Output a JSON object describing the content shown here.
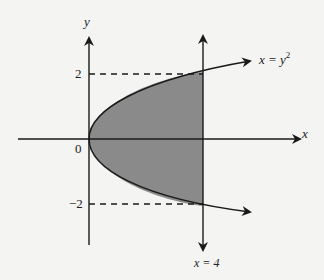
{
  "diagram": {
    "axes": {
      "x_label": "x",
      "y_label": "y",
      "origin_label": "0"
    },
    "ticks": {
      "y_pos": "2",
      "y_neg": "−2"
    },
    "curve_label_x": "x = y",
    "curve_label_exp": "2",
    "line_label": "x = 4",
    "colors": {
      "shade": "#8a8a8a",
      "stroke": "#1a1a1a",
      "background": "#f4f4f2"
    }
  }
}
